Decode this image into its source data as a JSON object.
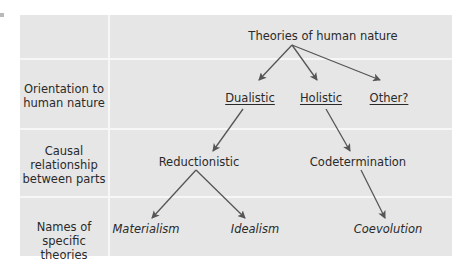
{
  "diagram": {
    "root": {
      "label": "Theories of human nature"
    },
    "rows": [
      {
        "label": ""
      },
      {
        "label": "Orientation to human nature",
        "line1": "Orientation to",
        "line2": "human nature"
      },
      {
        "label": "Causal relationship between parts",
        "line1": "Causal",
        "line2": "relationship",
        "line3": "between parts"
      },
      {
        "label": "Names of specific theories",
        "line1": "Names of",
        "line2": "specific theories"
      }
    ],
    "orientation": [
      {
        "label": "Dualistic",
        "underlined": true
      },
      {
        "label": "Holistic",
        "underlined": true
      },
      {
        "label": "Other?",
        "underlined": true
      }
    ],
    "causal": [
      {
        "label": "Reductionistic",
        "parent": "Dualistic"
      },
      {
        "label": "Codetermination",
        "parent": "Holistic"
      }
    ],
    "theories": [
      {
        "label": "Materialism",
        "parent": "Reductionistic",
        "italic": true
      },
      {
        "label": "Idealism",
        "parent": "Reductionistic",
        "italic": true
      },
      {
        "label": "Coevolution",
        "parent": "Codetermination",
        "italic": true
      }
    ],
    "colors": {
      "background": "#e6e6e6",
      "divider": "#f7f7f7",
      "arrow": "#555555",
      "text": "#2a2a2a"
    }
  }
}
